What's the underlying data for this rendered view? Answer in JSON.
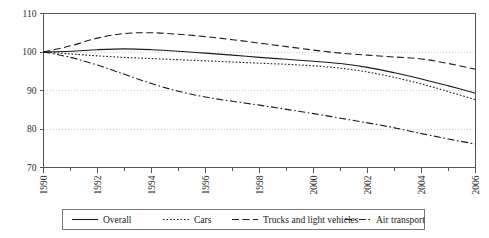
{
  "chart_data": {
    "type": "line",
    "title": "",
    "subtitle": "",
    "xlabel": "",
    "ylabel": "",
    "xlim": [
      1990,
      2006
    ],
    "ylim": [
      70,
      110
    ],
    "grid": true,
    "legend_position": "bottom",
    "y_ticks": [
      70,
      80,
      90,
      100,
      110
    ],
    "y_tick_labels": [
      "70",
      "80",
      "90",
      "100",
      "110"
    ],
    "x": [
      1990,
      1991,
      1992,
      1993,
      1994,
      1995,
      1996,
      1997,
      1998,
      1999,
      2000,
      2001,
      2002,
      2003,
      2004,
      2005,
      2006
    ],
    "x_tick_labels": [
      "1990",
      "",
      "1992",
      "",
      "1994",
      "",
      "1996",
      "",
      "1998",
      "",
      "2000",
      "",
      "2002",
      "",
      "2004",
      "",
      "2006"
    ],
    "x_labeled_ticks": [
      "1990",
      "1992",
      "1994",
      "1996",
      "1998",
      "2000",
      "2002",
      "2004",
      "2006"
    ],
    "x_tick_label_rotation": -90,
    "series": [
      {
        "name": "Overall",
        "style": "solid",
        "color": "#1a1a1a",
        "values": [
          100.0,
          100.2,
          100.6,
          100.8,
          100.6,
          100.2,
          99.7,
          99.2,
          98.6,
          98.1,
          97.6,
          97.0,
          96.0,
          94.6,
          93.0,
          91.2,
          89.3
        ]
      },
      {
        "name": "Cars",
        "style": "dotted",
        "color": "#1a1a1a",
        "values": [
          100.0,
          99.5,
          99.0,
          98.6,
          98.3,
          98.0,
          97.7,
          97.4,
          97.1,
          96.8,
          96.4,
          95.8,
          94.8,
          93.4,
          91.7,
          89.7,
          87.6
        ]
      },
      {
        "name": "Trucks and light vehicles",
        "style": "dashed",
        "color": "#1a1a1a",
        "values": [
          100.0,
          101.6,
          103.6,
          104.8,
          105.0,
          104.6,
          104.0,
          103.2,
          102.3,
          101.4,
          100.5,
          99.7,
          99.2,
          98.7,
          98.2,
          97.0,
          95.5
        ]
      },
      {
        "name": "Air transport",
        "style": "dashdot",
        "color": "#1a1a1a",
        "values": [
          100.0,
          98.6,
          96.6,
          94.2,
          91.8,
          89.8,
          88.3,
          87.2,
          86.2,
          85.1,
          84.0,
          82.8,
          81.6,
          80.3,
          78.8,
          77.4,
          76.1
        ]
      }
    ]
  },
  "legend": {
    "items": [
      {
        "label": "Overall",
        "style": "solid"
      },
      {
        "label": "Cars",
        "style": "dotted"
      },
      {
        "label": "Trucks and light vehicles",
        "style": "dashed"
      },
      {
        "label": "Air transport",
        "style": "dashdot"
      }
    ]
  },
  "axis": {
    "y_labels": [
      "110",
      "100",
      "90",
      "80",
      "70"
    ],
    "x_labels": [
      "1990",
      "1992",
      "1994",
      "1996",
      "1998",
      "2000",
      "2002",
      "2004",
      "2006"
    ]
  },
  "colors": {
    "line": "#1a1a1a",
    "grid": "#bfbfbf",
    "axis": "#555555",
    "legend_border": "#777777",
    "background": "#ffffff"
  }
}
